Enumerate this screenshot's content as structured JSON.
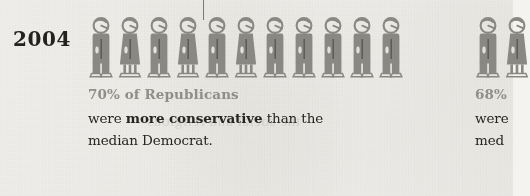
{
  "page": {
    "background_color": "#f4f3f0",
    "figure_color": "#8a8883",
    "highlight_text_color": "#908e89",
    "body_text_color": "#26251f",
    "year_label": "2004",
    "bleed_through_text": "the social and religious"
  },
  "marker": {
    "name": "median-marker",
    "x": 203,
    "top": 0,
    "height": 20,
    "color": "#7c7a75"
  },
  "chart_data": {
    "type": "pictogram",
    "title": "2004",
    "unit_label": "person",
    "panels": [
      {
        "id": "panel-2004",
        "year": "2004",
        "value": 70,
        "value_label": "70% of Republicans",
        "description_line_1": "were ",
        "description_bold": "more conservative",
        "description_line_1_tail": " than the",
        "description_line_2": "median Democrat.",
        "figure_count": 11,
        "median_index": 4,
        "figures": [
          {
            "index": 1,
            "type": "male",
            "x": 88
          },
          {
            "index": 2,
            "type": "female",
            "x": 117
          },
          {
            "index": 3,
            "type": "male",
            "x": 146
          },
          {
            "index": 4,
            "type": "female",
            "x": 175
          },
          {
            "index": 5,
            "type": "male",
            "x": 204
          },
          {
            "index": 6,
            "type": "female",
            "x": 233
          },
          {
            "index": 7,
            "type": "male",
            "x": 262
          },
          {
            "index": 8,
            "type": "male",
            "x": 291
          },
          {
            "index": 9,
            "type": "male",
            "x": 320
          },
          {
            "index": 10,
            "type": "male",
            "x": 349
          },
          {
            "index": 11,
            "type": "male",
            "x": 378
          }
        ]
      },
      {
        "id": "panel-next-clipped",
        "value": 68,
        "value_label": "68%",
        "description_line_1": "were",
        "description_line_2": "med",
        "clipped": true,
        "figure_count": 2,
        "figures": [
          {
            "index": 1,
            "type": "male",
            "x": 475
          },
          {
            "index": 2,
            "type": "female",
            "x": 504
          }
        ]
      }
    ]
  }
}
